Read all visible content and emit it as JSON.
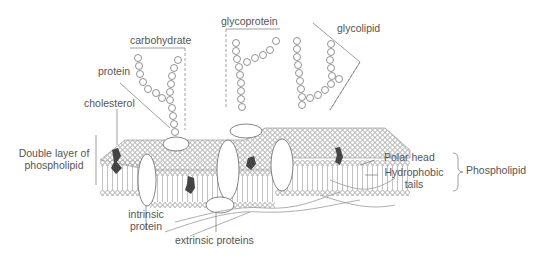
{
  "diagram": {
    "type": "labeled-illustration",
    "colors": {
      "line": "#777777",
      "text": "#555555",
      "cholesterol": "#444444",
      "background": "#ffffff"
    }
  },
  "labels": {
    "carbohydrate": "carbohydrate",
    "glycoprotein": "glycoprotein",
    "glycolipid": "glycolipid",
    "protein": "protein",
    "cholesterol": "cholesterol",
    "double_layer_line1": "Double layer of",
    "double_layer_line2": "phospholipid",
    "intrinsic_line1": "intrinsic",
    "intrinsic_line2": "protein",
    "extrinsic": "extrinsic proteins",
    "polar_head": "Polar head",
    "hydrophobic_line1": "Hydrophobic",
    "hydrophobic_line2": "tails",
    "phospholipid": "Phospholipid"
  }
}
